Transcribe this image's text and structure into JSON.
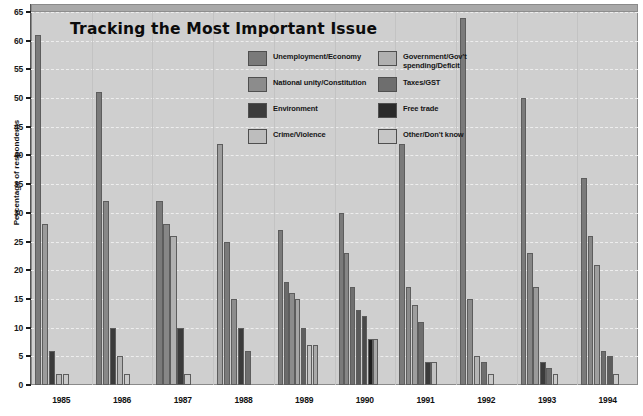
{
  "chart_data": {
    "type": "bar",
    "title": "Tracking the Most Important Issue",
    "xlabel": "",
    "ylabel": "Percentage of respondents",
    "ylim": [
      0,
      65
    ],
    "ytick_step": 5,
    "yticks": [
      0,
      5,
      10,
      15,
      20,
      25,
      30,
      35,
      40,
      45,
      50,
      55,
      60,
      65
    ],
    "grid": true,
    "legend_position": "inside-top-right",
    "categories": [
      "1985",
      "1986",
      "1987",
      "1988",
      "1989",
      "1990",
      "1991",
      "1992",
      "1993",
      "1994"
    ],
    "series": [
      {
        "name": "Unemployment/Economy",
        "color": "#7a7a7a",
        "values": [
          61,
          32,
          10,
          25,
          18,
          23,
          42,
          64,
          50,
          36
        ]
      },
      {
        "name": "National unity/Constitution",
        "color": "#8c8c8c",
        "values": [
          2,
          51,
          32,
          15,
          27,
          30,
          14,
          4,
          17,
          5
        ]
      },
      {
        "name": "Environment",
        "color": "#3b3b3b",
        "values": [
          6,
          10,
          10,
          10,
          15,
          12,
          4,
          2,
          3,
          2
        ]
      },
      {
        "name": "Crime/Violence",
        "color": "#bdbdbd",
        "values": [
          0,
          0,
          0,
          0,
          7,
          8,
          0,
          0,
          0,
          21
        ]
      },
      {
        "name": "Government/Gov't spending/Deficit",
        "color": "#b0b0b0",
        "values": [
          28,
          4,
          26,
          42,
          16,
          17,
          17,
          15,
          23,
          26
        ]
      },
      {
        "name": "Taxes/GST",
        "color": "#6e6e6e",
        "values": [
          2,
          2,
          2,
          6,
          10,
          13,
          11,
          5,
          4,
          6
        ]
      },
      {
        "name": "Free trade",
        "color": "#2a2a2a",
        "values": [
          0,
          0,
          0,
          0,
          7,
          8,
          0,
          0,
          0,
          0
        ]
      },
      {
        "name": "Other/Don't know",
        "color": "#c6c6c6",
        "values": [
          2,
          2,
          2,
          0,
          7,
          4,
          4,
          2,
          2,
          2
        ]
      }
    ],
    "groups": [
      {
        "year": "1985",
        "bars": [
          {
            "series": "Unemployment/Economy",
            "value": 61,
            "color": "#7a7a7a"
          },
          {
            "series": "Government/Gov't spending/Deficit",
            "value": 28,
            "color": "#9b9b9b"
          },
          {
            "series": "Environment",
            "value": 6,
            "color": "#3b3b3b"
          },
          {
            "series": "Taxes/GST",
            "value": 2,
            "color": "#b8b8b8"
          },
          {
            "series": "Other/Don't know",
            "value": 2,
            "color": "#c9c9c9"
          }
        ]
      },
      {
        "year": "1986",
        "bars": [
          {
            "series": "National unity/Constitution",
            "value": 51,
            "color": "#7a7a7a"
          },
          {
            "series": "Unemployment/Economy",
            "value": 32,
            "color": "#878787"
          },
          {
            "series": "Environment",
            "value": 10,
            "color": "#3b3b3b"
          },
          {
            "series": "Government/Gov't spending/Deficit",
            "value": 5,
            "color": "#b4b4b4"
          },
          {
            "series": "Other/Don't know",
            "value": 2,
            "color": "#c9c9c9"
          }
        ]
      },
      {
        "year": "1987",
        "bars": [
          {
            "series": "Unemployment/Economy",
            "value": 32,
            "color": "#7a7a7a"
          },
          {
            "series": "National unity/Constitution",
            "value": 28,
            "color": "#878787"
          },
          {
            "series": "Government/Gov't spending/Deficit",
            "value": 26,
            "color": "#b0b0b0"
          },
          {
            "series": "Environment",
            "value": 10,
            "color": "#3b3b3b"
          },
          {
            "series": "Other/Don't know",
            "value": 2,
            "color": "#c9c9c9"
          }
        ]
      },
      {
        "year": "1988",
        "bars": [
          {
            "series": "Free trade",
            "value": 42,
            "color": "#9e9e9e"
          },
          {
            "series": "Unemployment/Economy",
            "value": 25,
            "color": "#7a7a7a"
          },
          {
            "series": "National unity/Constitution",
            "value": 15,
            "color": "#8c8c8c"
          },
          {
            "series": "Environment",
            "value": 10,
            "color": "#3b3b3b"
          },
          {
            "series": "Taxes/GST",
            "value": 6,
            "color": "#6e6e6e"
          }
        ]
      },
      {
        "year": "1989",
        "bars": [
          {
            "series": "Unemployment/Economy",
            "value": 27,
            "color": "#7a7a7a"
          },
          {
            "series": "Environment",
            "value": 18,
            "color": "#6a6a6a"
          },
          {
            "series": "National unity/Constitution",
            "value": 16,
            "color": "#8c8c8c"
          },
          {
            "series": "Government/Gov't spending/Deficit",
            "value": 15,
            "color": "#a6a6a6"
          },
          {
            "series": "Taxes/GST",
            "value": 10,
            "color": "#5f5f5f"
          },
          {
            "series": "Free trade",
            "value": 7,
            "color": "#c2c2c2"
          },
          {
            "series": "Other/Don't know",
            "value": 7,
            "color": "#a9a9a9"
          }
        ]
      },
      {
        "year": "1990",
        "bars": [
          {
            "series": "Unemployment/Economy",
            "value": 30,
            "color": "#7a7a7a"
          },
          {
            "series": "National unity/Constitution",
            "value": 23,
            "color": "#868686"
          },
          {
            "series": "Government/Gov't spending/Deficit",
            "value": 17,
            "color": "#6f6f6f"
          },
          {
            "series": "Taxes/GST",
            "value": 13,
            "color": "#5a5a5a"
          },
          {
            "series": "Environment",
            "value": 12,
            "color": "#4a4a4a"
          },
          {
            "series": "Free trade",
            "value": 8,
            "color": "#1f1f1f"
          },
          {
            "series": "Other/Don't know",
            "value": 8,
            "color": "#a9a9a9"
          }
        ]
      },
      {
        "year": "1991",
        "bars": [
          {
            "series": "Unemployment/Economy",
            "value": 42,
            "color": "#7a7a7a"
          },
          {
            "series": "National unity/Constitution",
            "value": 17,
            "color": "#8a8a8a"
          },
          {
            "series": "Government/Gov't spending/Deficit",
            "value": 14,
            "color": "#9e9e9e"
          },
          {
            "series": "Taxes/GST",
            "value": 11,
            "color": "#6e6e6e"
          },
          {
            "series": "Environment",
            "value": 4,
            "color": "#3b3b3b"
          },
          {
            "series": "Other/Don't know",
            "value": 4,
            "color": "#c2c2c2"
          }
        ]
      },
      {
        "year": "1992",
        "bars": [
          {
            "series": "Unemployment/Economy",
            "value": 64,
            "color": "#7a7a7a"
          },
          {
            "series": "National unity/Constitution",
            "value": 15,
            "color": "#8a8a8a"
          },
          {
            "series": "Government/Gov't spending/Deficit",
            "value": 5,
            "color": "#b4b4b4"
          },
          {
            "series": "Taxes/GST",
            "value": 4,
            "color": "#6e6e6e"
          },
          {
            "series": "Other/Don't know",
            "value": 2,
            "color": "#c9c9c9"
          }
        ]
      },
      {
        "year": "1993",
        "bars": [
          {
            "series": "Unemployment/Economy",
            "value": 50,
            "color": "#7a7a7a"
          },
          {
            "series": "Government/Gov't spending/Deficit",
            "value": 23,
            "color": "#868686"
          },
          {
            "series": "National unity/Constitution",
            "value": 17,
            "color": "#9a9a9a"
          },
          {
            "series": "Environment",
            "value": 4,
            "color": "#3b3b3b"
          },
          {
            "series": "Taxes/GST",
            "value": 3,
            "color": "#6e6e6e"
          },
          {
            "series": "Other/Don't know",
            "value": 2,
            "color": "#c9c9c9"
          }
        ]
      },
      {
        "year": "1994",
        "bars": [
          {
            "series": "Unemployment/Economy",
            "value": 36,
            "color": "#7a7a7a"
          },
          {
            "series": "Government/Gov't spending/Deficit",
            "value": 26,
            "color": "#878787"
          },
          {
            "series": "Crime/Violence",
            "value": 21,
            "color": "#9e9e9e"
          },
          {
            "series": "Taxes/GST",
            "value": 6,
            "color": "#6e6e6e"
          },
          {
            "series": "National unity/Constitution",
            "value": 5,
            "color": "#5c5c5c"
          },
          {
            "series": "Other/Don't know",
            "value": 2,
            "color": "#c9c9c9"
          }
        ]
      }
    ]
  },
  "legend": {
    "items": [
      {
        "label": "Unemployment/Economy",
        "color": "#7a7a7a",
        "col": 0,
        "row": 0
      },
      {
        "label": "National unity/Constitution",
        "color": "#8c8c8c",
        "col": 0,
        "row": 1
      },
      {
        "label": "Environment",
        "color": "#3b3b3b",
        "col": 0,
        "row": 2
      },
      {
        "label": "Crime/Violence",
        "color": "#bdbdbd",
        "col": 0,
        "row": 3
      },
      {
        "label": "Government/Gov't\nspending/Deficit",
        "color": "#b0b0b0",
        "col": 1,
        "row": 0
      },
      {
        "label": "Taxes/GST",
        "color": "#6e6e6e",
        "col": 1,
        "row": 1
      },
      {
        "label": "Free trade",
        "color": "#2a2a2a",
        "col": 1,
        "row": 2
      },
      {
        "label": "Other/Don't know",
        "color": "#c6c6c6",
        "col": 1,
        "row": 3
      }
    ]
  },
  "theme": {
    "plot_background": "#cfcfcf",
    "page_background": "#ffffff",
    "gridline_color": "#eeeeee",
    "axis_color": "#1a1a1a",
    "title_color": "#0b0b0b"
  }
}
